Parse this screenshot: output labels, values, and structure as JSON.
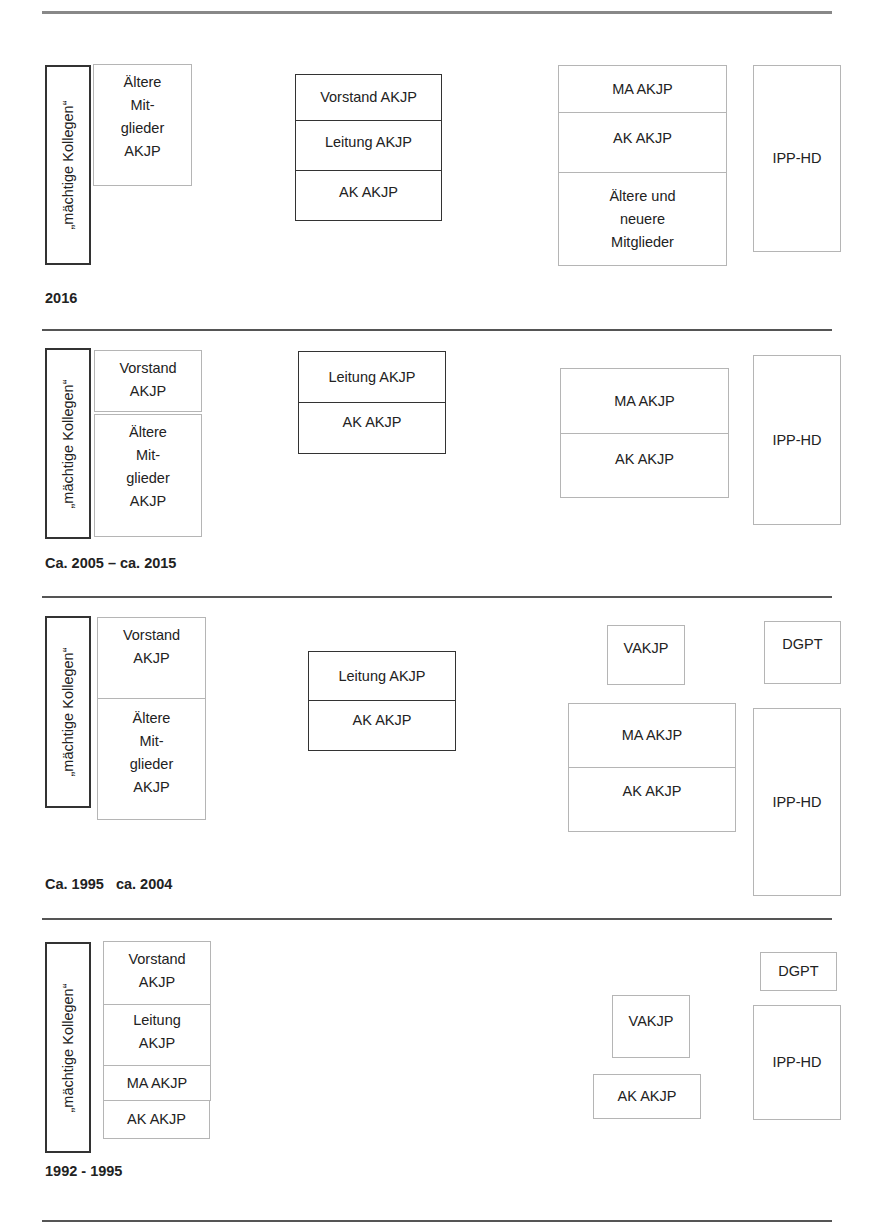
{
  "header": {
    "partial_text": ""
  },
  "vertical_label": "„mächtige Kollegen“",
  "sections": [
    {
      "period": "2016",
      "left_stack": [
        "Ältere Mit- glieder AKJP"
      ],
      "middle_stack": [
        "Vorstand AKJP",
        "Leitung AKJP",
        "AK AKJP"
      ],
      "right_stack": [
        "MA AKJP",
        "AK AKJP",
        "Ältere und neuere Mitglieder"
      ],
      "far_right": [
        "IPP-HD"
      ]
    },
    {
      "period": "Ca. 2005 – ca. 2015",
      "left_stack": [
        "Vorstand AKJP",
        "Ältere Mit- glieder AKJP"
      ],
      "middle_stack": [
        "Leitung AKJP",
        "AK AKJP"
      ],
      "right_stack": [
        "MA AKJP",
        "AK AKJP"
      ],
      "far_right": [
        "IPP-HD"
      ]
    },
    {
      "period": "Ca. 1995   ca. 2004",
      "left_stack": [
        "Vorstand AKJP",
        "Ältere Mit- glieder AKJP"
      ],
      "middle_stack": [
        "Leitung AKJP",
        "AK AKJP"
      ],
      "right_stack": [
        "VAKJP",
        "MA AKJP",
        "AK AKJP"
      ],
      "far_right": [
        "DGPT",
        "IPP-HD"
      ]
    },
    {
      "period": "1992 - 1995",
      "left_stack": [
        "Vorstand AKJP",
        "Leitung AKJP",
        "MA AKJP",
        "AK AKJP"
      ],
      "right_stack": [
        "VAKJP",
        "AK AKJP"
      ],
      "far_right": [
        "DGPT",
        "IPP-HD"
      ]
    }
  ],
  "lines": {
    "aeltere": [
      "Ältere",
      "Mit-",
      "glieder",
      "AKJP"
    ],
    "vorstand": [
      "Vorstand",
      "AKJP"
    ],
    "leitung": [
      "Leitung",
      "AKJP"
    ],
    "aeltere_neuere": [
      "Ältere und",
      "neuere",
      "Mitglieder"
    ]
  },
  "colors": {
    "dark_border": "#333333",
    "light_border": "#b5b5b5",
    "rule": "#555555"
  }
}
